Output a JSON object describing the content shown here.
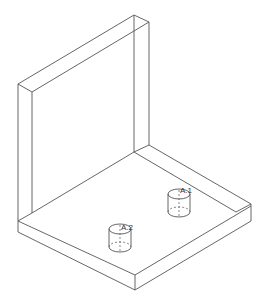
{
  "drawing": {
    "type": "isometric-wireframe",
    "description": "L-shaped bracket with vertical wall and base plate, two cylindrical pins",
    "line_color": "#555555",
    "background": "#ffffff"
  },
  "labels": {
    "pin1": "A.1",
    "pin2": "A.2"
  }
}
